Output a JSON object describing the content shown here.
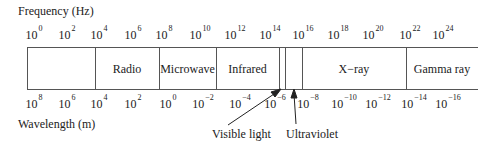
{
  "frequency_axis": {
    "title": "Frequency (Hz)",
    "ticks": [
      {
        "base": "10",
        "exp": "0",
        "x": 34
      },
      {
        "base": "10",
        "exp": "2",
        "x": 67
      },
      {
        "base": "10",
        "exp": "4",
        "x": 99
      },
      {
        "base": "10",
        "exp": "6",
        "x": 133
      },
      {
        "base": "10",
        "exp": "8",
        "x": 164
      },
      {
        "base": "10",
        "exp": "10",
        "x": 200
      },
      {
        "base": "10",
        "exp": "12",
        "x": 235
      },
      {
        "base": "10",
        "exp": "14",
        "x": 270
      },
      {
        "base": "10",
        "exp": "16",
        "x": 303
      },
      {
        "base": "10",
        "exp": "18",
        "x": 338
      },
      {
        "base": "10",
        "exp": "20",
        "x": 373
      },
      {
        "base": "10",
        "exp": "22",
        "x": 410
      },
      {
        "base": "10",
        "exp": "24",
        "x": 443
      }
    ]
  },
  "wavelength_axis": {
    "title": "Wavelength (m)",
    "ticks": [
      {
        "base": "10",
        "exp": "8",
        "x": 34
      },
      {
        "base": "10",
        "exp": "6",
        "x": 67
      },
      {
        "base": "10",
        "exp": "4",
        "x": 99
      },
      {
        "base": "10",
        "exp": "2",
        "x": 133
      },
      {
        "base": "10",
        "exp": "0",
        "x": 168
      },
      {
        "base": "10",
        "exp": "−2",
        "x": 203
      },
      {
        "base": "10",
        "exp": "−4",
        "x": 240
      },
      {
        "base": "10",
        "exp": "−6",
        "x": 275
      },
      {
        "base": "10",
        "exp": "−8",
        "x": 308
      },
      {
        "base": "10",
        "exp": "−10",
        "x": 344
      },
      {
        "base": "10",
        "exp": "−12",
        "x": 378
      },
      {
        "base": "10",
        "exp": "−14",
        "x": 414
      },
      {
        "base": "10",
        "exp": "−16",
        "x": 448
      }
    ]
  },
  "bands": [
    {
      "label": "",
      "x1": 27,
      "x2": 95
    },
    {
      "label": "Radio",
      "x1": 95,
      "x2": 159
    },
    {
      "label": "Microwave",
      "x1": 159,
      "x2": 216
    },
    {
      "label": "Infrared",
      "x1": 216,
      "x2": 279
    },
    {
      "label": "",
      "x1": 279,
      "x2": 285
    },
    {
      "label": "",
      "x1": 285,
      "x2": 302
    },
    {
      "label": "X−ray",
      "x1": 302,
      "x2": 406
    },
    {
      "label": "Gamma ray",
      "x1": 406,
      "x2": 478
    }
  ],
  "annotations": {
    "visible_light": "Visible light",
    "ultraviolet": "Ultraviolet"
  }
}
